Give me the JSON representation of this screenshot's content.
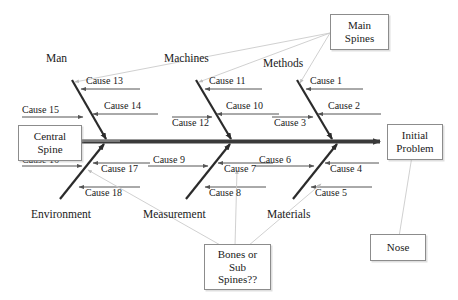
{
  "diagram": {
    "type": "fishbone-ishikawa",
    "spine": {
      "label": "central-spine",
      "arrow_to": "Initial Problem"
    },
    "categories": [
      {
        "name": "Man",
        "position": "top",
        "causes": [
          "Cause 13",
          "Cause 14",
          "Cause 15"
        ]
      },
      {
        "name": "Machines",
        "position": "top",
        "causes": [
          "Cause 11",
          "Cause 10",
          "Cause 12"
        ]
      },
      {
        "name": "Methods",
        "position": "top",
        "causes": [
          "Cause 1",
          "Cause 2",
          "Cause 3"
        ]
      },
      {
        "name": "Environment",
        "position": "bottom",
        "causes": [
          "Cause 16",
          "Cause 17",
          "Cause 18"
        ]
      },
      {
        "name": "Measurement",
        "position": "bottom",
        "causes": [
          "Cause 9",
          "Cause 7",
          "Cause 8"
        ]
      },
      {
        "name": "Materials",
        "position": "bottom",
        "causes": [
          "Cause 6",
          "Cause 4",
          "Cause 5"
        ]
      }
    ],
    "category_labels": {
      "man": "Man",
      "machines": "Machines",
      "methods": "Methods",
      "environment": "Environment",
      "measurement": "Measurement",
      "materials": "Materials"
    },
    "causes": {
      "c1": "Cause 1",
      "c2": "Cause 2",
      "c3": "Cause 3",
      "c4": "Cause 4",
      "c5": "Cause 5",
      "c6": "Cause 6",
      "c7": "Cause 7",
      "c8": "Cause 8",
      "c9": "Cause 9",
      "c10": "Cause 10",
      "c11": "Cause 11",
      "c12": "Cause 12",
      "c13": "Cause 13",
      "c14": "Cause 14",
      "c15": "Cause 15",
      "c16": "Cause 16",
      "c17": "Cause 17",
      "c18": "Cause 18"
    },
    "callouts": {
      "main_spines": {
        "line1": "Main",
        "line2": "Spines"
      },
      "central_spine": {
        "line1": "Central",
        "line2": "Spine"
      },
      "initial_problem": {
        "line1": "Initial",
        "line2": "Problem"
      },
      "bones_sub_spines": {
        "line1": "Bones or",
        "line2": "Sub",
        "line3": "Spines??"
      },
      "nose": {
        "line1": "Nose"
      }
    },
    "colors": {
      "spine": "#3a3a3a",
      "bone": "#2b2b2b",
      "cause_line": "#555555",
      "leader_line": "#c9c9c9",
      "box_border": "#8c8c8c",
      "text": "#1a1a1a",
      "background": "#ffffff"
    }
  }
}
